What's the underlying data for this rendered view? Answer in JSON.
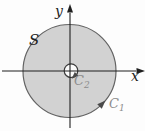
{
  "figure": {
    "labels": {
      "y_axis": "y",
      "x_axis": "x",
      "region": "S",
      "outer_curve_main": "C",
      "outer_curve_sub": "1",
      "inner_curve_main": "C",
      "inner_curve_sub": "2"
    },
    "colors": {
      "background": "#fdfdfd",
      "region_fill": "#d2d2d2",
      "region_stroke": "#636363",
      "inner_fill": "#fcfcfc",
      "inner_stroke": "#3d3d3d",
      "axis_stroke": "#1f1f1f",
      "curve_arrow": "#4a4a4a",
      "curve_label": "#8d8d8d",
      "region_label": "#222222",
      "axis_label": "#1f1f1f"
    }
  }
}
